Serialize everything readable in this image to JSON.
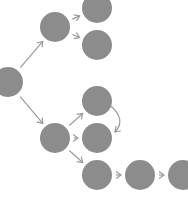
{
  "diagram": {
    "type": "tree",
    "colors": {
      "node": "#8c8c8c",
      "edge": "#9a9a9a",
      "background": "#ffffff"
    },
    "node_radius": 15,
    "nodes": [
      {
        "id": "A",
        "cx": 8,
        "cy": 82
      },
      {
        "id": "B",
        "cx": 55,
        "cy": 27
      },
      {
        "id": "C",
        "cx": 97,
        "cy": 8
      },
      {
        "id": "D",
        "cx": 97,
        "cy": 45
      },
      {
        "id": "E",
        "cx": 55,
        "cy": 138
      },
      {
        "id": "F",
        "cx": 97,
        "cy": 101
      },
      {
        "id": "G",
        "cx": 97,
        "cy": 138
      },
      {
        "id": "H",
        "cx": 97,
        "cy": 175
      },
      {
        "id": "I",
        "cx": 140,
        "cy": 175
      },
      {
        "id": "J",
        "cx": 183,
        "cy": 175
      }
    ],
    "edges": [
      {
        "from": "A",
        "to": "B",
        "kind": "straight"
      },
      {
        "from": "A",
        "to": "E",
        "kind": "straight"
      },
      {
        "from": "B",
        "to": "C",
        "kind": "straight"
      },
      {
        "from": "B",
        "to": "D",
        "kind": "straight"
      },
      {
        "from": "E",
        "to": "F",
        "kind": "straight"
      },
      {
        "from": "E",
        "to": "G",
        "kind": "straight"
      },
      {
        "from": "E",
        "to": "H",
        "kind": "straight"
      },
      {
        "from": "F",
        "to": "G",
        "kind": "curved"
      },
      {
        "from": "H",
        "to": "I",
        "kind": "straight"
      },
      {
        "from": "I",
        "to": "J",
        "kind": "straight"
      }
    ]
  }
}
